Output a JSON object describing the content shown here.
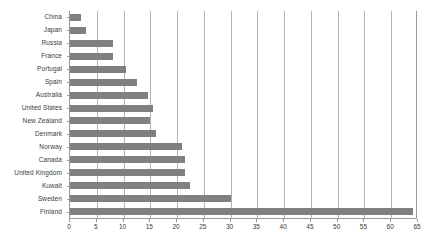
{
  "chart_data": {
    "type": "bar",
    "orientation": "horizontal",
    "title": "",
    "subtitle": "",
    "xlabel": "",
    "ylabel": "",
    "xlim": [
      0,
      65
    ],
    "xticks": [
      0,
      5,
      10,
      15,
      20,
      25,
      30,
      35,
      40,
      45,
      50,
      55,
      60,
      65
    ],
    "xtick_labels": [
      "0",
      "5",
      "10",
      "15",
      "20",
      "25",
      "30",
      "35",
      "40",
      "45",
      "50",
      "55",
      "60",
      "65"
    ],
    "grid": true,
    "grid_axis": "x",
    "legend": false,
    "legend_position": "none",
    "bar_color": "#808080",
    "gridline_color": "#b4b4b4",
    "axis_color": "#9a9a9a",
    "background_color": "#ffffff",
    "categories": [
      "China",
      "Japan",
      "Russia",
      "France",
      "Portugal",
      "Spain",
      "Australia",
      "United States",
      "New Zealand",
      "Denmark",
      "Norway",
      "Canada",
      "United Kingdom",
      "Kuwait",
      "Sweden",
      "Finland"
    ],
    "values": [
      2,
      3,
      8,
      8,
      10.5,
      12.5,
      14.5,
      15.5,
      15,
      16,
      21,
      21.5,
      21.5,
      22.5,
      30,
      64
    ]
  }
}
